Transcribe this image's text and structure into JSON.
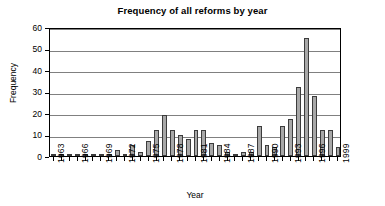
{
  "chart_data": {
    "type": "bar",
    "title": "Frequency of all reforms by year",
    "xlabel": "Year",
    "ylabel": "Frequency",
    "ylim": [
      0,
      60
    ],
    "yticks": [
      0,
      10,
      20,
      30,
      40,
      50,
      60
    ],
    "grid": true,
    "legend": "none",
    "xtick_labels": [
      "1963",
      "1966",
      "1969",
      "1972",
      "1975",
      "1978",
      "1981",
      "1984",
      "1987",
      "1990",
      "1993",
      "1996",
      "1999"
    ],
    "xtick_step": 3,
    "categories": [
      "1963",
      "1964",
      "1965",
      "1966",
      "1967",
      "1968",
      "1969",
      "1970",
      "1971",
      "1972",
      "1973",
      "1974",
      "1975",
      "1976",
      "1977",
      "1978",
      "1979",
      "1980",
      "1981",
      "1982",
      "1983",
      "1984",
      "1985",
      "1986",
      "1987",
      "1988",
      "1989",
      "1990",
      "1991",
      "1992",
      "1993",
      "1994",
      "1995",
      "1996",
      "1997",
      "1998",
      "1999"
    ],
    "values": [
      1,
      0,
      0,
      0,
      0,
      1,
      1,
      1,
      3,
      0,
      5,
      2,
      7,
      12,
      19,
      12,
      10,
      8,
      12,
      12,
      6,
      5,
      2,
      1,
      2,
      2,
      14,
      5,
      4,
      14,
      17,
      32,
      55,
      28,
      12,
      12,
      4
    ],
    "bar_color": "#a8a8a8",
    "bar_edge_color": "#3c3c3c"
  }
}
